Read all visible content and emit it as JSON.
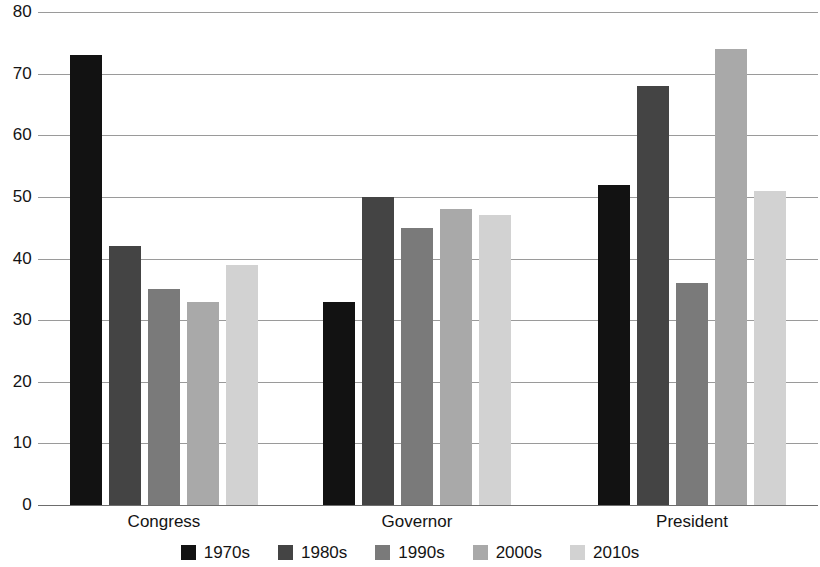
{
  "chart_data": {
    "type": "bar",
    "title": "",
    "subtitle": "",
    "xlabel": "",
    "ylabel": "",
    "categories": [
      "Congress",
      "Governor",
      "President"
    ],
    "series": [
      {
        "name": "1970s",
        "color": "#121212",
        "values": [
          73,
          33,
          52
        ]
      },
      {
        "name": "1980s",
        "color": "#444444",
        "values": [
          42,
          50,
          68
        ]
      },
      {
        "name": "1990s",
        "color": "#7a7a7a",
        "values": [
          35,
          45,
          36
        ]
      },
      {
        "name": "2000s",
        "color": "#a9a9a9",
        "values": [
          33,
          48,
          74
        ]
      },
      {
        "name": "2010s",
        "color": "#d2d2d2",
        "values": [
          39,
          47,
          51
        ]
      }
    ],
    "ylim": [
      0,
      80
    ],
    "ytick_step": 10,
    "yticks": [
      0,
      10,
      20,
      30,
      40,
      50,
      60,
      70,
      80
    ],
    "ytick_labels": [
      "0",
      "10",
      "20",
      "30",
      "40",
      "50",
      "60",
      "70",
      "80"
    ],
    "grid": true,
    "grid_axis": "y",
    "grid_color": "#9a9a9a",
    "legend_position": "bottom",
    "background": "#ffffff"
  }
}
